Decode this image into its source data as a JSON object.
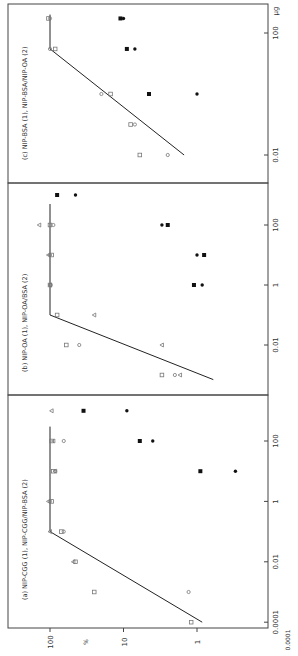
{
  "figure": {
    "orientation": "rotated-90-ccw",
    "ink_color": "#222222",
    "frame_color": "#444444",
    "open_marker_color": "#777777",
    "filled_marker_color": "#111111",
    "xlabel_unit": "µg",
    "ylabel_unit": "%",
    "footer_label": "0.0001"
  },
  "chart_data": [
    {
      "panel": "a",
      "type": "scatter",
      "title": "(a) NIP-CGG (1), NIP-CGG/NIP-BSA (2)",
      "xlabel": "µg",
      "ylabel": "%",
      "xscale": "log",
      "yscale": "log",
      "xlim": [
        5e-05,
        1000
      ],
      "ylim": [
        0.3,
        100
      ],
      "xticks": [
        "0.0001",
        "0.01",
        "1",
        "100"
      ],
      "yticks": [
        "100",
        "10",
        "1"
      ],
      "fit_line": [
        [
          0.0001,
          0.85
        ],
        [
          0.1,
          100
        ],
        [
          300,
          100
        ]
      ],
      "series": [
        {
          "name": "open circle",
          "marker": "o",
          "points": [
            [
              0.001,
              1.3
            ],
            [
              0.1,
              65
            ],
            [
              1,
              100
            ],
            [
              10,
              85
            ],
            [
              100,
              65
            ]
          ]
        },
        {
          "name": "open square",
          "marker": "s",
          "points": [
            [
              0.0001,
              1.2
            ],
            [
              0.001,
              25
            ],
            [
              0.01,
              45
            ],
            [
              0.1,
              70
            ],
            [
              1,
              95
            ],
            [
              10,
              90
            ],
            [
              100,
              95
            ]
          ]
        },
        {
          "name": "open triangle",
          "marker": "^",
          "points": [
            [
              0.01,
              48
            ],
            [
              0.1,
              100
            ],
            [
              1,
              105
            ],
            [
              10,
              85
            ],
            [
              100,
              90
            ],
            [
              1000,
              95
            ]
          ]
        },
        {
          "name": "filled square",
          "marker": "S",
          "points": [
            [
              10,
              0.9
            ],
            [
              100,
              6
            ],
            [
              1000,
              35
            ]
          ]
        },
        {
          "name": "filled circle",
          "marker": "O",
          "points": [
            [
              10,
              0.3
            ],
            [
              100,
              4
            ],
            [
              1000,
              9
            ]
          ]
        }
      ]
    },
    {
      "panel": "b",
      "type": "scatter",
      "title": "(b) NIP-OA (1), NIP-OA/BSA (2)",
      "xlabel": "µg",
      "ylabel": "%",
      "xscale": "log",
      "yscale": "log",
      "xlim": [
        0.0005,
        5000
      ],
      "ylim": [
        0.3,
        100
      ],
      "xticks": [
        "0.01",
        "1",
        "100"
      ],
      "yticks": [
        "100",
        "10",
        "1"
      ],
      "fit_line": [
        [
          0.0007,
          0.6
        ],
        [
          0.1,
          100
        ],
        [
          500,
          100
        ]
      ],
      "series": [
        {
          "name": "open circle",
          "marker": "o",
          "points": [
            [
              0.001,
              2
            ],
            [
              0.01,
              40
            ],
            [
              1,
              98
            ],
            [
              10,
              100
            ],
            [
              100,
              90
            ]
          ]
        },
        {
          "name": "open square",
          "marker": "s",
          "points": [
            [
              0.001,
              3
            ],
            [
              0.01,
              60
            ],
            [
              0.1,
              80
            ],
            [
              1,
              100
            ],
            [
              10,
              95
            ],
            [
              100,
              100
            ]
          ]
        },
        {
          "name": "open triangle",
          "marker": "^",
          "points": [
            [
              0.001,
              1.7
            ],
            [
              0.01,
              3
            ],
            [
              0.1,
              25
            ],
            [
              1,
              100
            ],
            [
              10,
              105
            ],
            [
              100,
              140
            ]
          ]
        },
        {
          "name": "filled square",
          "marker": "S",
          "points": [
            [
              1,
              1.1
            ],
            [
              10,
              0.8
            ],
            [
              100,
              2.5
            ],
            [
              1000,
              80
            ]
          ]
        },
        {
          "name": "filled circle",
          "marker": "O",
          "points": [
            [
              1,
              0.85
            ],
            [
              10,
              1.0
            ],
            [
              100,
              3.0
            ],
            [
              1000,
              45
            ]
          ]
        }
      ]
    },
    {
      "panel": "c",
      "type": "scatter",
      "title": "(c) NIP-BSA (1), NIP-BSA/NIP-OA (2)",
      "xlabel": "µg",
      "ylabel": "%",
      "xscale": "log",
      "yscale": "log",
      "xlim": [
        0.0005,
        1000
      ],
      "ylim": [
        0.3,
        100
      ],
      "xticks": [
        "0.01",
        "100"
      ],
      "yticks": [
        "100",
        "10",
        "1"
      ],
      "fit_line": [
        [
          0.01,
          1.5
        ],
        [
          30,
          100
        ],
        [
          400,
          100
        ]
      ],
      "series": [
        {
          "name": "open circle",
          "marker": "o",
          "points": [
            [
              0.001,
              1.2
            ],
            [
              0.01,
              2.5
            ],
            [
              0.1,
              7
            ],
            [
              1,
              20
            ],
            [
              30,
              100
            ],
            [
              300,
              100
            ]
          ]
        },
        {
          "name": "open square",
          "marker": "s",
          "points": [
            [
              0.01,
              6
            ],
            [
              0.1,
              8
            ],
            [
              1,
              15
            ],
            [
              30,
              85
            ],
            [
              300,
              105
            ]
          ]
        },
        {
          "name": "filled square",
          "marker": "S",
          "points": [
            [
              1,
              4.5
            ],
            [
              30,
              9
            ],
            [
              300,
              11
            ]
          ]
        },
        {
          "name": "filled circle",
          "marker": "O",
          "points": [
            [
              1,
              1.0
            ],
            [
              30,
              7
            ],
            [
              300,
              10
            ]
          ]
        }
      ]
    }
  ]
}
